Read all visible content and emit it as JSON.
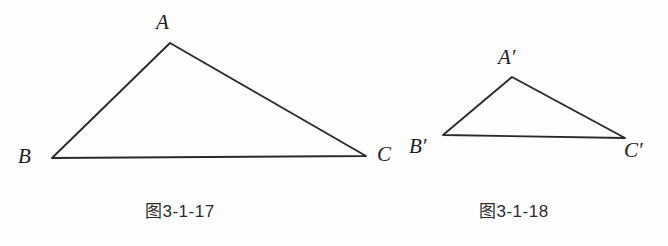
{
  "page": {
    "background_color": "#fefefe",
    "stroke_color": "#2a2a2e",
    "text_color": "#1c1c1c",
    "width": 668,
    "height": 246
  },
  "figures": [
    {
      "id": "figure-left",
      "caption": "图3-1-17",
      "caption_x": 145,
      "caption_y": 203,
      "vertices": [
        {
          "name": "A",
          "label": "A",
          "x": 170,
          "y": 43,
          "label_x": 156,
          "label_y": 12
        },
        {
          "name": "B",
          "label": "B",
          "x": 52,
          "y": 158,
          "label_x": 18,
          "label_y": 146
        },
        {
          "name": "C",
          "label": "C",
          "x": 366,
          "y": 156,
          "label_x": 377,
          "label_y": 144
        }
      ]
    },
    {
      "id": "figure-right",
      "caption": "图3-1-18",
      "caption_x": 479,
      "caption_y": 203,
      "vertices": [
        {
          "name": "A-prime",
          "label": "A′",
          "x": 512,
          "y": 77,
          "label_x": 498,
          "label_y": 47
        },
        {
          "name": "B-prime",
          "label": "B′",
          "x": 443,
          "y": 135,
          "label_x": 409,
          "label_y": 136
        },
        {
          "name": "C-prime",
          "label": "C′",
          "x": 625,
          "y": 138,
          "label_x": 624,
          "label_y": 140
        }
      ]
    }
  ],
  "chart_data": {
    "type": "diagram",
    "shapes": [
      {
        "name": "triangle-ABC",
        "caption": "图3-1-17",
        "points": [
          [
            170,
            43
          ],
          [
            52,
            158
          ],
          [
            366,
            156
          ]
        ],
        "labels": [
          "A",
          "B",
          "C"
        ]
      },
      {
        "name": "triangle-A-prime-B-prime-C-prime",
        "caption": "图3-1-18",
        "points": [
          [
            512,
            77
          ],
          [
            443,
            135
          ],
          [
            625,
            138
          ]
        ],
        "labels": [
          "A′",
          "B′",
          "C′"
        ]
      }
    ]
  }
}
